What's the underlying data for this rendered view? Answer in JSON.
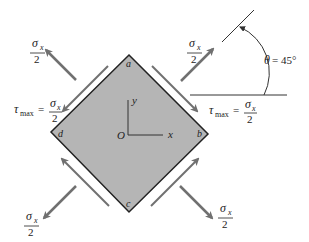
{
  "diagram": {
    "type": "stress-element-rotated",
    "element": {
      "corners": {
        "a": "a",
        "b": "b",
        "c": "c",
        "d": "d"
      },
      "fill": "#b5b5b5",
      "stroke": "#222222"
    },
    "axes": {
      "origin": "O",
      "x": "x",
      "y": "y"
    },
    "normal_stress": {
      "numerator": "σ",
      "subscript": "x",
      "denominator": "2"
    },
    "shear_stress": {
      "symbol": "τ",
      "subscript": "max",
      "equals": "=",
      "numerator": "σ",
      "num_subscript": "x",
      "denominator": "2"
    },
    "angle": {
      "symbol": "θ",
      "equals": "= 45°"
    },
    "arrow_color": "#707070"
  }
}
